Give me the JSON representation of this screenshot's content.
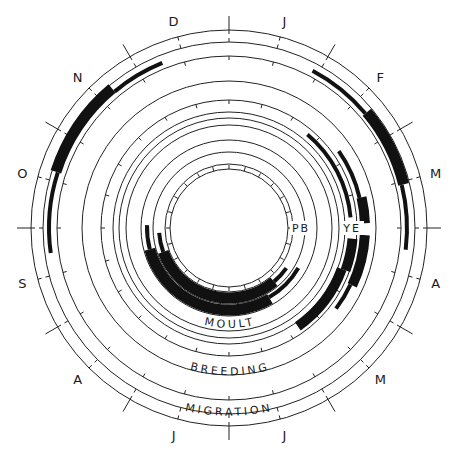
{
  "chart_data": {
    "type": "circular-phenology",
    "title": "",
    "months": [
      "J",
      "F",
      "M",
      "A",
      "M",
      "J",
      "J",
      "A",
      "S",
      "O",
      "N",
      "D"
    ],
    "center": [
      229,
      228
    ],
    "rings": [
      {
        "name": "MIGRATION",
        "label": "MIGRATION",
        "r_outer": 198,
        "r_inner": 186,
        "bars": [
          {
            "start_deg": 28,
            "end_deg": 50,
            "width": 4,
            "r": 178
          },
          {
            "start_deg": 50,
            "end_deg": 76,
            "width": 11,
            "r": 180
          },
          {
            "start_deg": 76,
            "end_deg": 97,
            "width": 4,
            "r": 178
          },
          {
            "start_deg": 262,
            "end_deg": 288,
            "width": 4,
            "r": 180
          },
          {
            "start_deg": 288,
            "end_deg": 320,
            "width": 11,
            "r": 182
          },
          {
            "start_deg": 320,
            "end_deg": 338,
            "width": 4,
            "r": 178
          }
        ]
      },
      {
        "name": "BREEDING",
        "label": "BREEDING",
        "r_outer": 172,
        "r_inner": 128
      },
      {
        "name": "YE",
        "label": "YE",
        "bars": [
          {
            "start_deg": 40,
            "end_deg": 85,
            "width": 4,
            "r": 122
          },
          {
            "start_deg": 95,
            "end_deg": 110,
            "width": 10,
            "r": 124
          },
          {
            "start_deg": 110,
            "end_deg": 145,
            "width": 10,
            "r": 120
          },
          {
            "start_deg": 55,
            "end_deg": 77,
            "width": 4,
            "r": 134
          },
          {
            "start_deg": 77,
            "end_deg": 88,
            "width": 10,
            "r": 136
          },
          {
            "start_deg": 93,
            "end_deg": 115,
            "width": 10,
            "r": 136
          },
          {
            "start_deg": 115,
            "end_deg": 127,
            "width": 4,
            "r": 134
          }
        ]
      },
      {
        "name": "PB",
        "label": "PB",
        "bars": [
          {
            "start_deg": 255,
            "end_deg": 272,
            "width": 4,
            "r": 82
          },
          {
            "start_deg": 150,
            "end_deg": 255,
            "width": 11,
            "r": 82
          },
          {
            "start_deg": 120,
            "end_deg": 150,
            "width": 4,
            "r": 80
          },
          {
            "start_deg": 250,
            "end_deg": 266,
            "width": 4,
            "r": 70
          },
          {
            "start_deg": 140,
            "end_deg": 250,
            "width": 11,
            "r": 70
          },
          {
            "start_deg": 125,
            "end_deg": 140,
            "width": 4,
            "r": 70
          }
        ]
      },
      {
        "name": "MOULT",
        "label": "MOULT"
      }
    ]
  },
  "labels": {
    "months": [
      {
        "text": "J",
        "deg": 15
      },
      {
        "text": "F",
        "deg": 45
      },
      {
        "text": "M",
        "deg": 75
      },
      {
        "text": "A",
        "deg": 105
      },
      {
        "text": "M",
        "deg": 135
      },
      {
        "text": "J",
        "deg": 165
      },
      {
        "text": "J",
        "deg": 195
      },
      {
        "text": "A",
        "deg": 225
      },
      {
        "text": "S",
        "deg": 255
      },
      {
        "text": "O",
        "deg": 285
      },
      {
        "text": "N",
        "deg": 315
      },
      {
        "text": "D",
        "deg": 345
      }
    ],
    "moult": "MOULT",
    "breeding": "BREEDING",
    "migration": "MIGRATION",
    "pb": "PB",
    "ye": "YE"
  }
}
